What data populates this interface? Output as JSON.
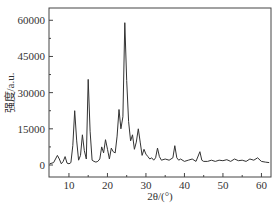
{
  "chart_data": {
    "type": "line",
    "title": "",
    "xlabel": "2θ/(°)",
    "ylabel": "强度/a.u.",
    "xlim": [
      5,
      62
    ],
    "ylim": [
      -3000,
      67000
    ],
    "xticks": [
      10,
      20,
      30,
      40,
      50,
      60
    ],
    "yticks": [
      0,
      15000,
      30000,
      45000,
      60000
    ],
    "grid": false,
    "legend": null,
    "series": [
      {
        "name": "XRD pattern",
        "color": "#333333",
        "x": [
          5,
          6,
          7,
          7.5,
          8,
          8.5,
          9,
          9.5,
          10,
          10.5,
          11,
          11.5,
          12,
          12.5,
          13,
          13.5,
          14,
          14.5,
          15,
          15.5,
          16,
          16.5,
          17,
          17.5,
          18,
          18.5,
          19,
          19.5,
          20,
          20.5,
          21,
          21.5,
          22,
          22.5,
          23,
          23.5,
          24,
          24.5,
          25,
          25.5,
          26,
          26.5,
          27,
          27.5,
          28,
          28.5,
          29,
          29.5,
          30,
          30.5,
          31,
          31.5,
          32,
          32.5,
          33,
          33.5,
          34,
          35,
          36,
          37,
          37.5,
          38,
          38.5,
          39,
          40,
          41,
          42,
          43,
          44,
          44.5,
          45,
          46,
          47,
          48,
          49,
          50,
          51,
          52,
          53,
          54,
          55,
          56,
          57,
          58,
          59,
          60,
          61,
          62
        ],
        "y": [
          500,
          1000,
          4000,
          2500,
          500,
          1500,
          3500,
          800,
          500,
          1000,
          8000,
          22500,
          10000,
          2000,
          4000,
          12500,
          6000,
          2500,
          35500,
          14000,
          2000,
          1500,
          1200,
          1500,
          2500,
          7500,
          5000,
          10500,
          6500,
          2500,
          7000,
          5500,
          5000,
          12000,
          23000,
          15000,
          20000,
          59000,
          35000,
          18000,
          10000,
          12500,
          6500,
          9500,
          15000,
          9500,
          4000,
          6500,
          4500,
          3500,
          2500,
          3000,
          2000,
          3000,
          7000,
          3500,
          2000,
          2500,
          2000,
          3000,
          8000,
          3000,
          2000,
          2500,
          1500,
          2000,
          2500,
          1500,
          5500,
          2000,
          1500,
          1500,
          2000,
          1500,
          2000,
          1800,
          2200,
          1500,
          2500,
          1800,
          2000,
          1500,
          2500,
          2000,
          3000,
          1500,
          1200,
          1000
        ]
      }
    ]
  }
}
